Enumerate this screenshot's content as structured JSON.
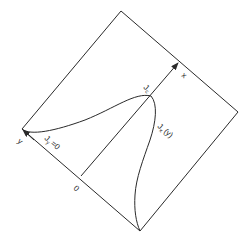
{
  "diagram": {
    "axes": {
      "x_label": "x",
      "y_label": "y",
      "origin_label": "0"
    },
    "labels": {
      "peak": "J",
      "peak_sub": "c",
      "boundary_main": "J",
      "boundary_sub": "y",
      "boundary_suffix": "=0",
      "profile_main": "J",
      "profile_sub": "x",
      "profile_suffix": "(y)"
    },
    "colors": {
      "line": "#2a2a2a",
      "background": "#ffffff"
    }
  }
}
